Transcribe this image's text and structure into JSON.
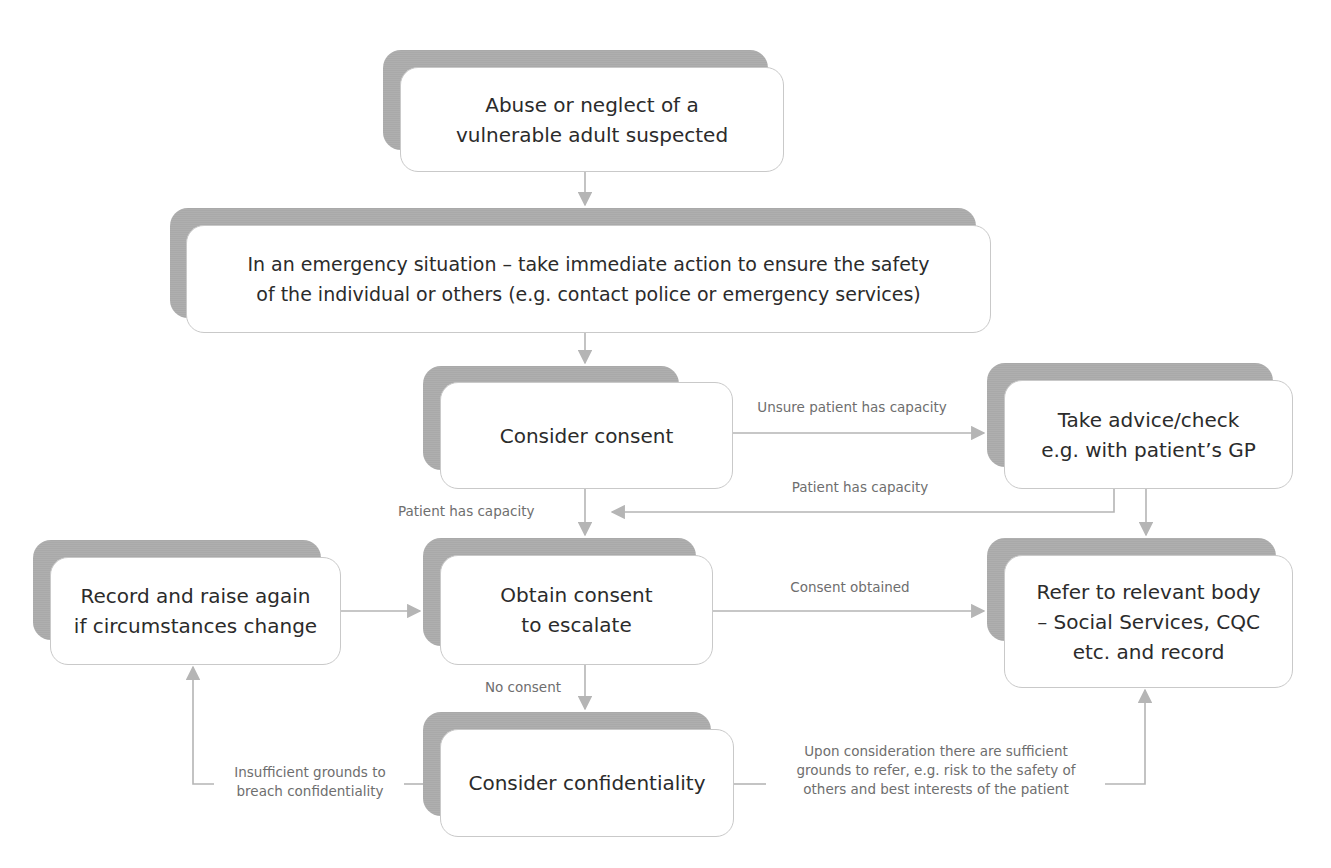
{
  "diagram": {
    "colors": {
      "shadow": "#a9a9a9",
      "box_fill": "#ffffff",
      "box_border": "#c9c9c9",
      "arrow": "#b5b5b5",
      "text": "#2b2b2b",
      "label_text": "#6e6e6e"
    },
    "nodes": {
      "abuse_suspected": "Abuse or neglect of a\nvulnerable adult suspected",
      "emergency": "In an emergency situation – take immediate action to ensure the safety\nof the individual or others (e.g. contact police or emergency services)",
      "consider_consent": "Consider consent",
      "take_advice": "Take advice/check\ne.g. with patient’s GP",
      "record_raise": "Record and raise again\nif circumstances change",
      "obtain_consent": "Obtain consent\nto escalate",
      "refer": "Refer to relevant body\n– Social Services, CQC\netc. and record",
      "consider_confidentiality": "Consider confidentiality"
    },
    "edge_labels": {
      "unsure_capacity": "Unsure patient has capacity",
      "patient_has_capacity_right": "Patient has capacity",
      "patient_has_capacity_left": "Patient has capacity",
      "consent_obtained": "Consent obtained",
      "no_consent": "No consent",
      "insufficient_grounds": "Insufficient grounds to\nbreach confidentiality",
      "sufficient_grounds": "Upon consideration there are sufficient\ngrounds to refer, e.g. risk to the safety of\nothers and best interests of the patient"
    }
  }
}
